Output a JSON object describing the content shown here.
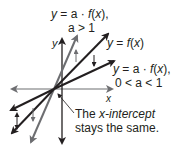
{
  "labels": {
    "stretch_eq": "y = a · f(x),",
    "stretch_cond": "a > 1",
    "base_eq": "y = f(x)",
    "shrink_eq": "y = a · f(x),",
    "shrink_cond": "0 < a < 1",
    "x_axis": "x",
    "y_axis": "y",
    "note_line1_a": "The ",
    "note_line1_b": "x-intercept",
    "note_line2": "stays the same."
  },
  "colors": {
    "dark": "#231f20",
    "gray": "#6d6e71"
  }
}
